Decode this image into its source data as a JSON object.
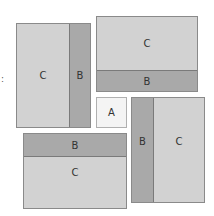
{
  "diagram": {
    "colors": {
      "C": "#d2d2d2",
      "B": "#a9a9a9",
      "A": "#f4f4f4",
      "border": "#8a8a8a"
    },
    "center": {
      "label": "A"
    },
    "tiles": [
      {
        "position": "top-left",
        "c_label": "C",
        "b_label": "B",
        "b_side": "right"
      },
      {
        "position": "top-right",
        "c_label": "C",
        "b_label": "B",
        "b_side": "bottom"
      },
      {
        "position": "bottom-left",
        "c_label": "C",
        "b_label": "B",
        "b_side": "top"
      },
      {
        "position": "bottom-right",
        "c_label": "C",
        "b_label": "B",
        "b_side": "left"
      }
    ],
    "edge_mark": ":"
  }
}
